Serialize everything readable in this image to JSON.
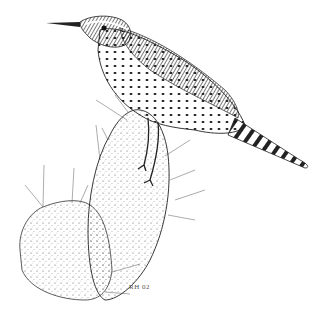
{
  "illustration": {
    "subject": "Cactus wren perched on prickly pear cactus",
    "style": "pen-and-ink stipple drawing",
    "signature": "RH 02",
    "colors": {
      "ink": "#1a1a1a",
      "paper": "#ffffff"
    }
  }
}
